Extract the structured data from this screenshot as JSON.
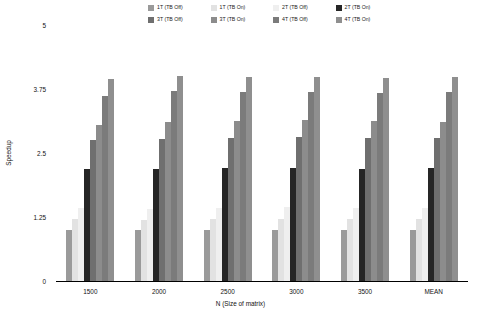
{
  "chart_data": {
    "type": "bar",
    "title": "",
    "xlabel": "N (Size of matrix)",
    "ylabel": "Speedup",
    "categories": [
      "1500",
      "2000",
      "2500",
      "3000",
      "3500",
      "MEAN"
    ],
    "yticks": [
      "0",
      "1.25",
      "2.5",
      "3.75",
      "5"
    ],
    "ytick_values": [
      0,
      1.25,
      2.5,
      3.75,
      5
    ],
    "ylim": [
      0,
      5
    ],
    "grid": false,
    "legend_position": "top",
    "series": [
      {
        "name": "1T (TB Off)",
        "color": "#9a9a9a",
        "values": [
          1.0,
          1.0,
          1.0,
          1.0,
          1.0,
          1.0
        ]
      },
      {
        "name": "1T (TB On)",
        "color": "#e2e2e2",
        "values": [
          1.22,
          1.2,
          1.22,
          1.22,
          1.21,
          1.22
        ]
      },
      {
        "name": "2T (TB Off)",
        "color": "#efefef",
        "values": [
          1.42,
          1.4,
          1.43,
          1.44,
          1.43,
          1.43
        ]
      },
      {
        "name": "2T (TB On)",
        "color": "#262626",
        "values": [
          2.18,
          2.18,
          2.2,
          2.2,
          2.18,
          2.2
        ]
      },
      {
        "name": "3T (TB Off)",
        "color": "#6f6f6f",
        "values": [
          2.75,
          2.78,
          2.8,
          2.82,
          2.8,
          2.8
        ]
      },
      {
        "name": "3T (TB On)",
        "color": "#8c8c8c",
        "values": [
          3.05,
          3.1,
          3.12,
          3.15,
          3.12,
          3.1
        ]
      },
      {
        "name": "4T (TB Off)",
        "color": "#7b7b7b",
        "values": [
          3.62,
          3.72,
          3.7,
          3.7,
          3.68,
          3.7
        ]
      },
      {
        "name": "4T (TB On)",
        "color": "#8f8f8f",
        "values": [
          3.95,
          4.0,
          3.98,
          3.98,
          3.96,
          3.98
        ]
      }
    ]
  },
  "legend": {
    "items": [
      {
        "label": "1T (TB Off)",
        "color": "#9a9a9a"
      },
      {
        "label": "1T (TB On)",
        "color": "#e2e2e2"
      },
      {
        "label": "2T (TB Off)",
        "color": "#efefef"
      },
      {
        "label": "2T (TB On)",
        "color": "#262626"
      },
      {
        "label": "3T (TB Off)",
        "color": "#6f6f6f"
      },
      {
        "label": "3T (TB On)",
        "color": "#8c8c8c"
      },
      {
        "label": "4T (TB Off)",
        "color": "#7b7b7b"
      },
      {
        "label": "4T (TB On)",
        "color": "#8f8f8f"
      }
    ]
  },
  "axes": {
    "x_title": "N (Size of matrix)",
    "y_title": "Speedup"
  }
}
